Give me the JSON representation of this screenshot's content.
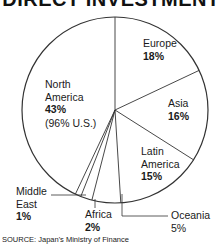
{
  "chart_data": {
    "type": "pie",
    "title": "DIRECT INVESTMENT",
    "slices": [
      {
        "label": "Europe",
        "value": 18
      },
      {
        "label": "Asia",
        "value": 16
      },
      {
        "label": "Latin America",
        "value": 15
      },
      {
        "label": "Oceania",
        "value": 5
      },
      {
        "label": "Africa",
        "value": 2
      },
      {
        "label": "Middle East",
        "value": 1
      },
      {
        "label": "North America",
        "value": 43,
        "note": "(96% U.S.)"
      }
    ],
    "start_angle": "12 o'clock",
    "direction": "clockwise",
    "legend": "none (direct labels)",
    "source": "SOURCE: Japan's Ministry of Finance"
  },
  "title": "DIRECT INVESTMENT",
  "labels": {
    "europe": {
      "name": "Europe",
      "pct": "18%"
    },
    "asia": {
      "name": "Asia",
      "pct": "16%"
    },
    "latin_america": {
      "name1": "Latin",
      "name2": "America",
      "pct": "15%"
    },
    "north_america": {
      "name1": "North",
      "name2": "America",
      "pct": "43%",
      "note": "(96% U.S.)"
    },
    "middle_east": {
      "name1": "Middle",
      "name2": "East",
      "pct": "1%"
    },
    "africa": {
      "name": "Africa",
      "pct": "2%"
    },
    "oceania": {
      "name": "Oceania",
      "pct": "5%"
    }
  },
  "source": "SOURCE: Japan's Ministry of Finance"
}
